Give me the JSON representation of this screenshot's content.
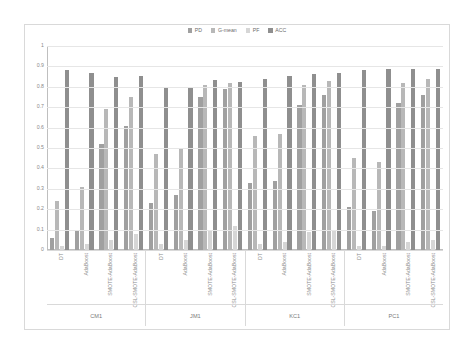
{
  "chart_data": {
    "type": "bar",
    "title": "",
    "xlabel": "",
    "ylabel": "",
    "ylim": [
      0,
      1
    ],
    "ytick_labels": [
      "1",
      "0.9",
      "0.8",
      "0.7",
      "0.6",
      "0.5",
      "0.4",
      "0.3",
      "0.2",
      "0.1",
      "0"
    ],
    "ytick_values": [
      1,
      0.9,
      0.8,
      0.7,
      0.6,
      0.5,
      0.4,
      0.3,
      0.2,
      0.1,
      0
    ],
    "grid": true,
    "legend_position": "top-center",
    "legend": [
      "PD",
      "G-mean",
      "PF",
      "ACC"
    ],
    "series": [
      {
        "name": "PD",
        "color": "#a0a0a0",
        "values": [
          0.06,
          0.1,
          0.52,
          0.61,
          0.23,
          0.27,
          0.75,
          0.79,
          0.33,
          0.34,
          0.71,
          0.76,
          0.21,
          0.19,
          0.72,
          0.76
        ]
      },
      {
        "name": "G-mean",
        "color": "#b8b8b8",
        "values": [
          0.24,
          0.31,
          0.69,
          0.75,
          0.47,
          0.5,
          0.81,
          0.82,
          0.56,
          0.57,
          0.81,
          0.83,
          0.45,
          0.43,
          0.82,
          0.84
        ]
      },
      {
        "name": "PF",
        "color": "#d6d6d6",
        "values": [
          0.02,
          0.03,
          0.05,
          0.08,
          0.03,
          0.05,
          0.1,
          0.12,
          0.03,
          0.04,
          0.09,
          0.1,
          0.02,
          0.02,
          0.04,
          0.05
        ]
      },
      {
        "name": "ACC",
        "color": "#8f8f8f",
        "values": [
          0.88,
          0.87,
          0.85,
          0.855,
          0.795,
          0.8,
          0.835,
          0.825,
          0.84,
          0.855,
          0.865,
          0.87,
          0.88,
          0.885,
          0.885,
          0.885
        ]
      }
    ],
    "datasets": [
      "CM1",
      "JM1",
      "KC1",
      "PC1"
    ],
    "methods": [
      "DT",
      "AdaBoost",
      "SMOTE-AdaBoost",
      "CSL-SMOTE-AdaBoost"
    ],
    "categories": [
      "CM1 / DT",
      "CM1 / AdaBoost",
      "CM1 / SMOTE-AdaBoost",
      "CM1 / CSL-SMOTE-AdaBoost",
      "JM1 / DT",
      "JM1 / AdaBoost",
      "JM1 / SMOTE-AdaBoost",
      "JM1 / CSL-SMOTE-AdaBoost",
      "KC1 / DT",
      "KC1 / AdaBoost",
      "KC1 / SMOTE-AdaBoost",
      "KC1 / CSL-SMOTE-AdaBoost",
      "PC1 / DT",
      "PC1 / AdaBoost",
      "PC1 / SMOTE-AdaBoost",
      "PC1 / CSL-SMOTE-AdaBoost"
    ]
  }
}
